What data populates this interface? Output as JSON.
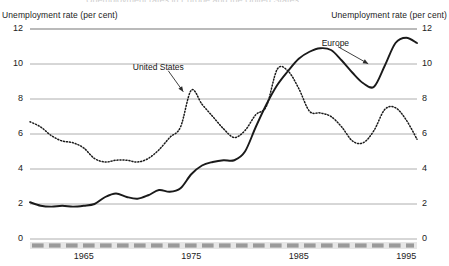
{
  "figure": {
    "cut_off_title": "Unemployment rates in Europe and the United States",
    "axis_title_left": "Unemployment rate (per cent)",
    "axis_title_right": "Unemployment rate (per cent)"
  },
  "chart_data": {
    "type": "line",
    "title": "",
    "xlabel": "",
    "ylabel": "Unemployment rate (per cent)",
    "ylabel_right": "Unemployment rate (per cent)",
    "xlim": [
      1960,
      1996
    ],
    "ylim": [
      0,
      12
    ],
    "yticks": [
      0,
      2,
      4,
      6,
      8,
      10,
      12
    ],
    "ytick_labels": [
      "0",
      "2",
      "4",
      "6",
      "8",
      "10",
      "12"
    ],
    "xticks": [
      1965,
      1975,
      1985,
      1995
    ],
    "xtick_labels": [
      "1965",
      "1975",
      "1985",
      "1995"
    ],
    "grid": true,
    "grid_axis": "y",
    "legend": "inline-annotations",
    "annotations": [
      {
        "text": "United States",
        "series": "United States",
        "at_x": 1974.4,
        "at_y": 8.3
      },
      {
        "text": "Europe",
        "series": "Europe",
        "at_x": 1991.6,
        "at_y": 9.9
      }
    ],
    "x": [
      1960,
      1961,
      1962,
      1963,
      1964,
      1965,
      1966,
      1967,
      1968,
      1969,
      1970,
      1971,
      1972,
      1973,
      1974,
      1975,
      1976,
      1977,
      1978,
      1979,
      1980,
      1981,
      1982,
      1983,
      1984,
      1985,
      1986,
      1987,
      1988,
      1989,
      1990,
      1991,
      1992,
      1993,
      1994,
      1995,
      1996
    ],
    "series": [
      {
        "name": "Europe",
        "style": "solid",
        "color": "#1a1a1a",
        "values": [
          2.1,
          1.9,
          1.85,
          1.9,
          1.85,
          1.9,
          2.0,
          2.4,
          2.6,
          2.4,
          2.3,
          2.5,
          2.8,
          2.7,
          2.9,
          3.7,
          4.2,
          4.4,
          4.5,
          4.5,
          5.0,
          6.4,
          7.7,
          8.8,
          9.6,
          10.3,
          10.7,
          10.9,
          10.8,
          10.2,
          9.5,
          8.9,
          8.7,
          9.9,
          11.2,
          11.5,
          11.2
        ]
      },
      {
        "name": "United States",
        "style": "dotted",
        "color": "#1a1a1a",
        "values": [
          6.7,
          6.4,
          5.9,
          5.6,
          5.5,
          5.2,
          4.6,
          4.4,
          4.5,
          4.5,
          4.4,
          4.6,
          5.1,
          5.8,
          6.4,
          8.5,
          7.7,
          7.0,
          6.3,
          5.8,
          6.2,
          7.1,
          7.6,
          9.7,
          9.6,
          8.6,
          7.3,
          7.2,
          7.0,
          6.4,
          5.6,
          5.5,
          6.2,
          7.4,
          7.5,
          6.8,
          5.7
        ]
      }
    ],
    "x_axis_band": {
      "style": "dashed-grey-band",
      "color": "#9a9a9a",
      "background": "#e6e6e6"
    }
  }
}
